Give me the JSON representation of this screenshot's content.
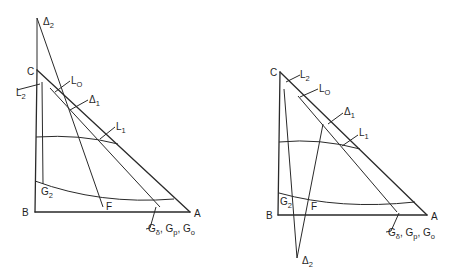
{
  "figure": {
    "panels": [
      {
        "id": "left",
        "vertices": {
          "A": "A",
          "B": "B",
          "C": "C"
        },
        "labels": {
          "delta2": "Δ",
          "delta2_sub": "2",
          "L0": "L",
          "L0_sub": "O",
          "L2": "L",
          "L2_sub": "2",
          "delta1": "Δ",
          "delta1_sub": "1",
          "L1": "L",
          "L1_sub": "1",
          "G2": "G",
          "G2_sub": "2",
          "F": "F",
          "G_group": "G",
          "G_group_sub1": "δ",
          "G_group_mid1": ", G",
          "G_group_sub2": "p",
          "G_group_mid2": ", G",
          "G_group_sub3": "o"
        }
      },
      {
        "id": "right",
        "vertices": {
          "A": "A",
          "B": "B",
          "C": "C"
        },
        "labels": {
          "delta2": "Δ",
          "delta2_sub": "2",
          "L0": "L",
          "L0_sub": "O",
          "L2": "L",
          "L2_sub": "2",
          "delta1": "Δ",
          "delta1_sub": "1",
          "L1": "L",
          "L1_sub": "1",
          "G2": "G",
          "G2_sub": "2",
          "F": "F",
          "G_group": "G",
          "G_group_sub1": "δ",
          "G_group_mid1": ", G",
          "G_group_sub2": "p",
          "G_group_mid2": ", G",
          "G_group_sub3": "o"
        }
      }
    ]
  }
}
